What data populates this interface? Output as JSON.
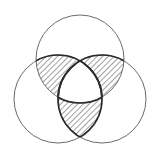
{
  "diagram": {
    "type": "venn",
    "sets": 3,
    "circles": [
      {
        "name": "top",
        "cx": 80,
        "cy": 59,
        "r": 44
      },
      {
        "name": "left",
        "cx": 58,
        "cy": 99,
        "r": 44
      },
      {
        "name": "right",
        "cx": 102,
        "cy": 99,
        "r": 44
      }
    ],
    "shaded_regions": [
      "top∩left only",
      "top∩right only",
      "left∩right only"
    ],
    "shading": "diagonal-hatch",
    "colors": {
      "background": "#ffffff",
      "outline": "#6a6a6a",
      "bold_outline": "#2b2b2b",
      "hatch": "#444444"
    }
  }
}
